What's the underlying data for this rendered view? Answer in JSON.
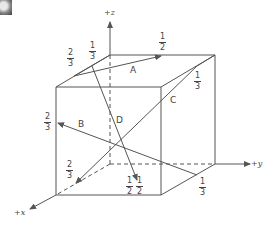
{
  "figure": {
    "type": "unit-cube-crystallographic-directions",
    "axes": {
      "z": "+z",
      "y": "+y",
      "x": "+x"
    },
    "vectors": [
      {
        "label": "A"
      },
      {
        "label": "B"
      },
      {
        "label": "C"
      },
      {
        "label": "D"
      }
    ],
    "fractions": [
      {
        "id": "top-left-2-3",
        "num": "2",
        "den": "3"
      },
      {
        "id": "top-left-1-3",
        "num": "1",
        "den": "3"
      },
      {
        "id": "top-1-2",
        "num": "1",
        "den": "2"
      },
      {
        "id": "right-1-3",
        "num": "1",
        "den": "3"
      },
      {
        "id": "left-2-3",
        "num": "2",
        "den": "3"
      },
      {
        "id": "bottom-left-2-3",
        "num": "2",
        "den": "3"
      },
      {
        "id": "bottom-1-2-a",
        "num": "1",
        "den": "2"
      },
      {
        "id": "bottom-1-2-b",
        "num": "1",
        "den": "2"
      },
      {
        "id": "bottom-right-1-3",
        "num": "1",
        "den": "3"
      }
    ],
    "colors": {
      "line": "#555555",
      "text": "#444444"
    }
  }
}
